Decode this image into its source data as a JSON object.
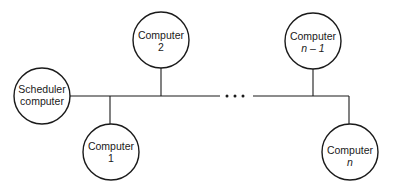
{
  "diagram": {
    "type": "bus-network",
    "nodes": [
      {
        "id": "scheduler",
        "line1": "Scheduler",
        "line2": "computer",
        "italic2": false
      },
      {
        "id": "computer-1",
        "line1": "Computer",
        "line2": "1",
        "italic2": false
      },
      {
        "id": "computer-2",
        "line1": "Computer",
        "line2": "2",
        "italic2": false
      },
      {
        "id": "computer-n-1",
        "line1": "Computer",
        "line2": "n – 1",
        "italic2": true
      },
      {
        "id": "computer-n",
        "line1": "Computer",
        "line2": "n",
        "italic2": true
      }
    ],
    "edges": [
      {
        "from": "scheduler",
        "to": "bus"
      },
      {
        "from": "computer-1",
        "to": "bus"
      },
      {
        "from": "computer-2",
        "to": "bus"
      },
      {
        "from": "computer-n-1",
        "to": "bus"
      },
      {
        "from": "computer-n",
        "to": "bus"
      }
    ],
    "ellipsis": "• • •",
    "colors": {
      "stroke": "#1a1a1a",
      "background": "#ffffff"
    }
  }
}
